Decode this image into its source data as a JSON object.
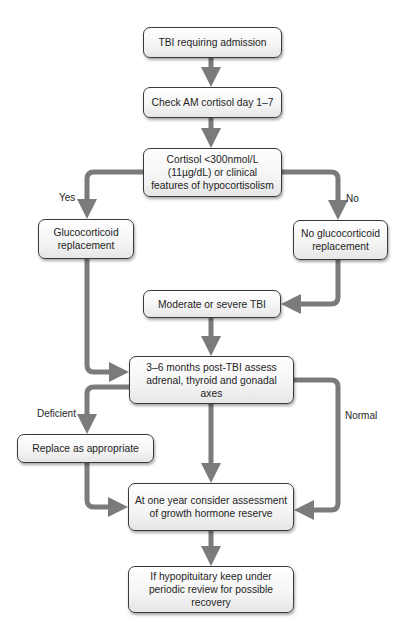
{
  "flowchart": {
    "nodes": {
      "tbi_admission": "TBI requiring admission",
      "check_cortisol": "Check AM cortisol day 1–7",
      "cortisol_decision": "Cortisol <300nmol/L (11µg/dL) or clinical features of hypocortisolism",
      "glucocorticoid_replacement": "Glucocorticoid replacement",
      "no_glucocorticoid_replacement": "No glucocorticoid replacement",
      "moderate_severe_tbi": "Moderate or severe TBI",
      "assess_axes": "3–6 months post-TBI assess adrenal, thyroid and gonadal axes",
      "replace_as_appropriate": "Replace as appropriate",
      "growth_hormone": "At one year consider assessment of growth hormone reserve",
      "periodic_review": "If hypopituitary keep under periodic review for possible recovery"
    },
    "edge_labels": {
      "yes": "Yes",
      "no": "No",
      "deficient": "Deficient",
      "normal": "Normal"
    },
    "colors": {
      "arrow": "#7b7b7b",
      "box_border": "#3a3a3a",
      "box_fill": "#f4f4f4",
      "text": "#1e1e1e"
    }
  }
}
